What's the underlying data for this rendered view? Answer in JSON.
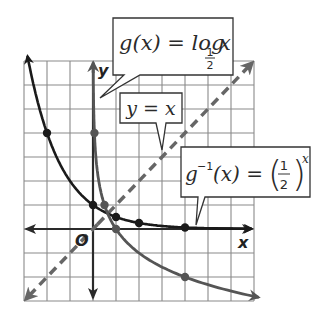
{
  "chart_data": {
    "type": "line",
    "title": "",
    "xlabel": "x",
    "ylabel": "y",
    "origin_label": "O",
    "xlim": [
      -3,
      7
    ],
    "ylim": [
      -3,
      7
    ],
    "grid": true,
    "colors": {
      "exponential": "#1a1a1a",
      "logarithm": "#555555",
      "identity": "#666666",
      "axes": "#2a2a2a",
      "grid": "#8a8a8a"
    },
    "series": [
      {
        "name": "g^-1(x) = (1/2)^x",
        "style": "solid",
        "points": [
          [
            -2,
            4
          ],
          [
            0,
            1
          ],
          [
            1,
            0.5
          ],
          [
            2,
            0.25
          ],
          [
            4,
            0.0625
          ]
        ],
        "domain": [
          -2.9,
          7
        ]
      },
      {
        "name": "g(x) = log_1/2 x",
        "style": "solid",
        "points": [
          [
            0.0625,
            4
          ],
          [
            0.5,
            1
          ],
          [
            1,
            0
          ],
          [
            4,
            -2
          ]
        ],
        "domain": [
          0.0078,
          7
        ]
      },
      {
        "name": "y = x",
        "style": "dashed",
        "domain": [
          -3,
          7
        ]
      }
    ],
    "annotations": [
      {
        "id": "log",
        "lhs": "g(x) = log",
        "base_num": "1",
        "base_den": "2",
        "rhs": "x"
      },
      {
        "id": "identity",
        "text": "y = x"
      },
      {
        "id": "inverse",
        "lhs": "g",
        "sup": "−1",
        "mid": "(x) = ",
        "num": "1",
        "den": "2",
        "exp": "x"
      }
    ]
  }
}
